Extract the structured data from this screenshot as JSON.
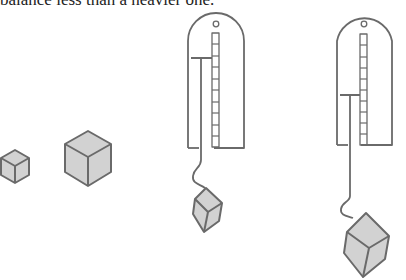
{
  "caption": "balance less than a heavier one.",
  "colors": {
    "stroke": "#6a6a6a",
    "cube_fill": "#cfcfcf",
    "cube_fill_light": "#dcdcdc",
    "background": "#ffffff"
  },
  "figures": {
    "small_cube": {
      "cx": 15,
      "cy": 166,
      "size": 16
    },
    "large_cube": {
      "cx": 88,
      "cy": 158,
      "size": 25
    },
    "scale_light": {
      "x": 187,
      "y": 12,
      "w": 58,
      "h": 136,
      "pointer_y": 48,
      "ticks": 10,
      "load": "small cube"
    },
    "scale_heavy": {
      "x": 336,
      "y": 12,
      "w": 57,
      "h": 133,
      "pointer_y": 94,
      "ticks": 10,
      "load": "large cube"
    }
  }
}
